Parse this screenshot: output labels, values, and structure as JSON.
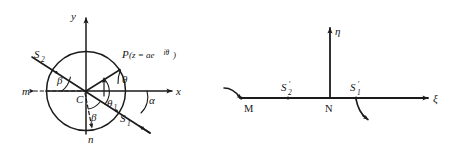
{
  "figure": {
    "caption": "",
    "ink_color": "#1b1b1b",
    "background_color": "#ffffff",
    "left_panel": {
      "name": "z-plane circular boundary diagram",
      "axes": {
        "x_label": "x",
        "y_label": "y"
      },
      "center_label": "C",
      "point_label": "P",
      "point_expression": "(z = ae",
      "point_exponent": "iθ",
      "point_expression_close": ")",
      "crack_labels": {
        "s1": "S",
        "s1_sub": "1",
        "s2": "S",
        "s2_sub": "2"
      },
      "dashed_endpoints": {
        "left": "m",
        "bottom": "n"
      },
      "angles": {
        "theta": "θ",
        "theta_c": "θ",
        "theta_c_sub": "c",
        "beta_upper": "β",
        "beta_lower": "β",
        "alpha": "α"
      }
    },
    "right_panel": {
      "name": "mapped half-plane diagram",
      "axes": {
        "xi_label": "ξ",
        "eta_label": "η"
      },
      "points": {
        "m": "M",
        "n": "N"
      },
      "crack_labels": {
        "s1": "S",
        "s1_sub": "1",
        "s1_prime": "′",
        "s2": "S",
        "s2_sub": "2",
        "s2_prime": "′"
      }
    }
  }
}
